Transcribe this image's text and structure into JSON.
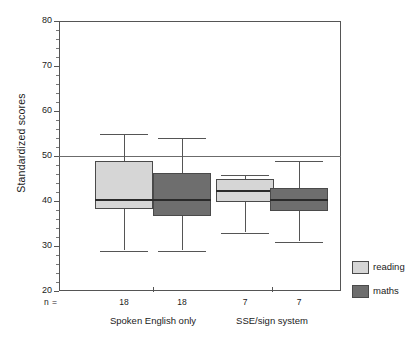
{
  "chart_data": {
    "type": "boxplot",
    "title": "",
    "xlabel": "",
    "ylabel": "Standardized scores",
    "ylim": [
      20,
      80
    ],
    "y_major_ticks": [
      20,
      30,
      40,
      50,
      60,
      70,
      80
    ],
    "y_minor_tick_step": 2,
    "grid": false,
    "reference_line": {
      "value": 50,
      "label": "50"
    },
    "legend_position": "right-bottom-outside",
    "n_prefix": "n =",
    "groups": [
      {
        "label": "Spoken English only",
        "n_labels": [
          "18",
          "18"
        ],
        "boxes": [
          {
            "series": "reading",
            "n": 18,
            "whisker_low": 29.0,
            "q1": 38.2,
            "median": 40.3,
            "q3": 48.8,
            "whisker_high": 55.0,
            "color": "#d6d6d6"
          },
          {
            "series": "maths",
            "n": 18,
            "whisker_low": 29.0,
            "q1": 36.7,
            "median": 40.2,
            "q3": 46.2,
            "whisker_high": 54.0,
            "color": "#6e6e6e"
          }
        ]
      },
      {
        "label": "SSE/sign system",
        "n_labels": [
          "7",
          "7"
        ],
        "boxes": [
          {
            "series": "reading",
            "n": 7,
            "whisker_low": 33.0,
            "q1": 39.8,
            "median": 42.2,
            "q3": 44.8,
            "whisker_high": 45.8,
            "color": "#d6d6d6"
          },
          {
            "series": "maths",
            "n": 7,
            "whisker_low": 31.0,
            "q1": 37.8,
            "median": 40.2,
            "q3": 43.0,
            "whisker_high": 49.0,
            "color": "#6e6e6e"
          }
        ]
      }
    ],
    "legend": [
      {
        "label": "reading",
        "color": "#d6d6d6"
      },
      {
        "label": "maths",
        "color": "#6e6e6e"
      }
    ]
  }
}
